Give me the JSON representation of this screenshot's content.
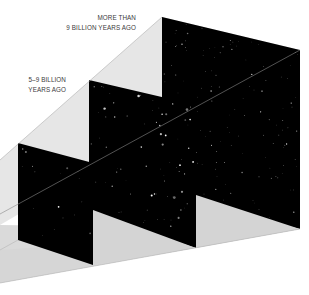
{
  "diagram": {
    "type": "perspective-look-back-time",
    "colors": {
      "background": "#ffffff",
      "wall": "#e4e4e4",
      "floor": "#d8d8d8",
      "panel": "#000000",
      "edge": "#9a9a9a",
      "star": "#ffffff"
    },
    "labels": [
      {
        "id": "far",
        "lines": [
          "MORE THAN",
          "9 BILLION YEARS AGO"
        ]
      },
      {
        "id": "mid",
        "lines": [
          "5–9 BILLION",
          "YEARS AGO"
        ]
      }
    ],
    "panels": [
      {
        "id": "far",
        "points": "162,17 300,50 300,229 162,196",
        "label": "MORE THAN 9 BILLION YEARS AGO"
      },
      {
        "id": "mid",
        "points": "89,80 196,105 196,248 89,214",
        "label": "5–9 BILLION YEARS AGO"
      },
      {
        "id": "near",
        "points": "18,143 93,163 93,265 18,240",
        "label": ""
      }
    ]
  }
}
